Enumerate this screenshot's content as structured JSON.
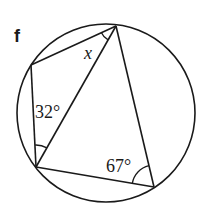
{
  "figure": {
    "label": "f",
    "stroke_color": "#1a1a1a",
    "background": "#ffffff",
    "circle": {
      "cx": 106,
      "cy": 113,
      "r": 89
    },
    "vertices": {
      "top": [
        116,
        26
      ],
      "left": [
        31,
        65
      ],
      "bottom_left": [
        36,
        167
      ],
      "bottom_right": [
        154,
        187
      ]
    },
    "angles": [
      {
        "id": "x",
        "text": "x",
        "italic": true,
        "x": 84,
        "y": 59
      },
      {
        "id": "a32",
        "text": "32°",
        "italic": false,
        "x": 35,
        "y": 118
      },
      {
        "id": "a67",
        "text": "67°",
        "italic": false,
        "x": 106,
        "y": 172
      }
    ]
  }
}
